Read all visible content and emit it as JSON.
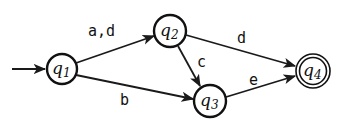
{
  "diagram": {
    "type": "finite-automaton",
    "states": [
      {
        "id": "q1",
        "name": "q",
        "sub": "1",
        "cx": 62,
        "cy": 69,
        "r": 15,
        "initial": true,
        "accepting": false
      },
      {
        "id": "q2",
        "name": "q",
        "sub": "2",
        "cx": 170,
        "cy": 31,
        "r": 16,
        "initial": false,
        "accepting": false
      },
      {
        "id": "q3",
        "name": "q",
        "sub": "3",
        "cx": 210,
        "cy": 101,
        "r": 16,
        "initial": false,
        "accepting": false
      },
      {
        "id": "q4",
        "name": "q",
        "sub": "4",
        "cx": 313,
        "cy": 71,
        "r": 17,
        "initial": false,
        "accepting": true
      }
    ],
    "transitions": [
      {
        "from": "q1",
        "to": "q2",
        "label": "a,d"
      },
      {
        "from": "q1",
        "to": "q3",
        "label": "b"
      },
      {
        "from": "q2",
        "to": "q3",
        "label": "c"
      },
      {
        "from": "q2",
        "to": "q4",
        "label": "d"
      },
      {
        "from": "q3",
        "to": "q4",
        "label": "e"
      }
    ]
  }
}
